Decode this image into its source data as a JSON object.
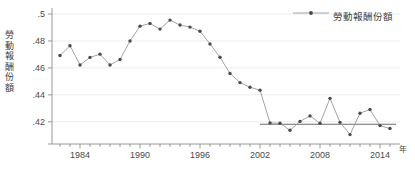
{
  "chart_data": {
    "type": "line",
    "title": "",
    "xlabel": "年",
    "ylabel": "勞動報酬份額",
    "xlim": [
      1981.2,
      2015.6
    ],
    "ylim": [
      0.4065,
      0.5015
    ],
    "grid": true,
    "grid_axis": "y",
    "legend_position": "top-right",
    "x": [
      1982,
      1983,
      1984,
      1985,
      1986,
      1987,
      1988,
      1989,
      1990,
      1991,
      1992,
      1993,
      1994,
      1995,
      1996,
      1997,
      1998,
      1999,
      2000,
      2001,
      2002,
      2003,
      2004,
      2005,
      2006,
      2007,
      2008,
      2009,
      2010,
      2011,
      2012,
      2013,
      2014,
      2015
    ],
    "xtick_values": [
      1984,
      1990,
      1996,
      2002,
      2008,
      2014
    ],
    "xtick_labels": [
      "1984",
      "1990",
      "1996",
      "2002",
      "2008",
      "2014"
    ],
    "ytick_values": [
      0.42,
      0.44,
      0.46,
      0.48,
      0.5
    ],
    "ytick_labels": [
      ".42",
      ".44",
      ".46",
      ".48",
      ".5"
    ],
    "series": [
      {
        "name": "勞動報酬份額",
        "marker": "filled-circle",
        "marker_color": "#4a4a4a",
        "line_color": "#9a9a9a",
        "values": [
          0.4692,
          0.4765,
          0.4622,
          0.4678,
          0.4702,
          0.4622,
          0.4662,
          0.48,
          0.491,
          0.493,
          0.4888,
          0.4955,
          0.4918,
          0.4903,
          0.4872,
          0.4778,
          0.4679,
          0.4559,
          0.4491,
          0.4456,
          0.4435,
          0.4192,
          0.4189,
          0.4137,
          0.4203,
          0.4244,
          0.4189,
          0.4374,
          0.4196,
          0.4105,
          0.4264,
          0.4291,
          0.4172,
          0.415
        ]
      }
    ],
    "reference_line": {
      "name": "平均水準",
      "y": 0.4182,
      "x_start": 2002,
      "x_end": 2015,
      "color": "#6b6b6b"
    }
  },
  "legend": {
    "entries": [
      {
        "label": "勞動報酬份額",
        "marker": "filled-circle",
        "color": "#4a4a4a"
      }
    ]
  },
  "axis": {
    "x_unit_label": "年",
    "y_axis_title_chars": [
      "勞",
      "動",
      "報",
      "酬",
      "份",
      "額"
    ]
  },
  "caption": {
    "text": ""
  },
  "colors": {
    "line": "#9a9a9a",
    "marker": "#4a4a4a",
    "reference_line": "#6b6b6b",
    "grid": "#ededed",
    "axis": "#8c8c8c",
    "text": "#4a4a4a",
    "background": "#ffffff"
  }
}
